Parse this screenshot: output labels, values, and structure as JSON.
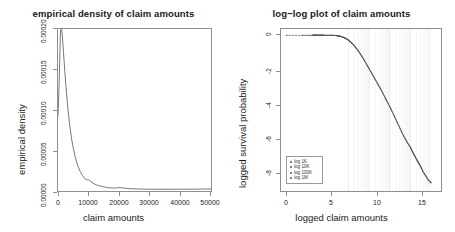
{
  "figure": {
    "background": "#ffffff",
    "axis_color": "#8f8f8f",
    "line_color": "#555555"
  },
  "panels": {
    "left": {
      "title": "empirical density of claim amounts",
      "xlabel": "claim amounts",
      "ylabel": "empirical density",
      "xticks": [
        "0",
        "10000",
        "20000",
        "30000",
        "40000",
        "50000"
      ],
      "yticks": [
        "0.00000",
        "0.00005",
        "0.00010",
        "0.00015",
        "0.00020"
      ]
    },
    "right": {
      "title": "log−log plot of claim amounts",
      "xlabel": "logged claim amounts",
      "ylabel": "logged survival probability",
      "xticks": [
        "0",
        "5",
        "10",
        "15"
      ],
      "yticks": [
        "0",
        "-2",
        "-4",
        "-6",
        "-8"
      ],
      "legend": {
        "items": [
          "log 1K",
          "log 10K",
          "log 100K",
          "log 1M"
        ]
      }
    }
  },
  "chart_data": [
    {
      "type": "line",
      "title": "empirical density of claim amounts",
      "xlabel": "claim amounts",
      "ylabel": "empirical density",
      "xlim": [
        0,
        50000
      ],
      "ylim": [
        0,
        0.00022
      ],
      "xticks": [
        0,
        10000,
        20000,
        30000,
        40000,
        50000
      ],
      "yticks": [
        0.0,
        5e-05,
        0.0001,
        0.00015,
        0.0002
      ],
      "grid": false,
      "legend": null,
      "x": [
        0,
        400,
        800,
        1100,
        1400,
        1800,
        2200,
        2700,
        3200,
        3800,
        4400,
        5000,
        5700,
        6400,
        7200,
        8000,
        8800,
        9400,
        9900,
        10400,
        11000,
        11800,
        12600,
        13500,
        14500,
        15500,
        16500,
        17500,
        18500,
        19400,
        20000,
        20600,
        21400,
        22500,
        24000,
        26000,
        28000,
        30000,
        33000,
        36000,
        40000,
        44000,
        47000,
        50000
      ],
      "y": [
        0.000102,
        0.00015,
        0.000216,
        0.000222,
        0.000212,
        0.000188,
        0.000164,
        0.000137,
        0.000113,
        9e-05,
        7.2e-05,
        5.8e-05,
        4.5e-05,
        3.5e-05,
        2.7e-05,
        2.1e-05,
        1.65e-05,
        1.5e-05,
        1.52e-05,
        1.42e-05,
        1.2e-05,
        9.8e-06,
        8.2e-06,
        7e-06,
        6e-06,
        5.2e-06,
        4.6e-06,
        4.2e-06,
        4e-06,
        4.3e-06,
        4.8e-06,
        4.5e-06,
        4e-06,
        3.5e-06,
        3e-06,
        2.7e-06,
        2.5e-06,
        2.4e-06,
        2.3e-06,
        2.3e-06,
        2.4e-06,
        2.5e-06,
        2.6e-06,
        2.8e-06
      ]
    },
    {
      "type": "scatter",
      "title": "log-log plot of claim amounts",
      "xlabel": "logged claim amounts",
      "ylabel": "logged survival probability",
      "xlim": [
        -0.6,
        17.2
      ],
      "ylim": [
        -9.2,
        0.35
      ],
      "xticks": [
        0,
        5,
        10,
        15
      ],
      "yticks": [
        0,
        -2,
        -4,
        -6,
        -8
      ],
      "grid": true,
      "grid_axis": "x",
      "legend_position": "lower left",
      "series": [
        {
          "name": "survival",
          "x": [
            0.0,
            1.8,
            2.9,
            3.2,
            3.6,
            4.0,
            4.4,
            4.8,
            5.2,
            5.5,
            5.8,
            6.0,
            6.3,
            6.6,
            6.9,
            7.2,
            7.5,
            7.8,
            8.1,
            8.4,
            8.7,
            9.0,
            9.3,
            9.6,
            9.9,
            10.2,
            10.5,
            10.8,
            11.1,
            11.4,
            11.7,
            12.0,
            12.3,
            12.6,
            12.9,
            13.2,
            13.5,
            13.8,
            14.0,
            14.2,
            14.4,
            14.6,
            14.8,
            15.0,
            15.2,
            15.5,
            15.8,
            16.1
          ],
          "y": [
            -0.02,
            -0.02,
            -0.015,
            -0.012,
            -0.012,
            -0.013,
            -0.015,
            -0.018,
            -0.025,
            -0.035,
            -0.055,
            -0.08,
            -0.13,
            -0.2,
            -0.3,
            -0.44,
            -0.6,
            -0.8,
            -1.02,
            -1.26,
            -1.52,
            -1.8,
            -2.08,
            -2.36,
            -2.64,
            -2.92,
            -3.2,
            -3.5,
            -3.82,
            -4.12,
            -4.44,
            -4.78,
            -5.12,
            -5.46,
            -5.8,
            -6.1,
            -6.38,
            -6.62,
            -6.85,
            -7.05,
            -7.25,
            -7.45,
            -7.62,
            -7.82,
            -8.05,
            -8.3,
            -8.55,
            -8.72
          ]
        }
      ],
      "legend_items": [
        "log 1K",
        "log 10K",
        "log 100K",
        "log 1M"
      ]
    }
  ]
}
